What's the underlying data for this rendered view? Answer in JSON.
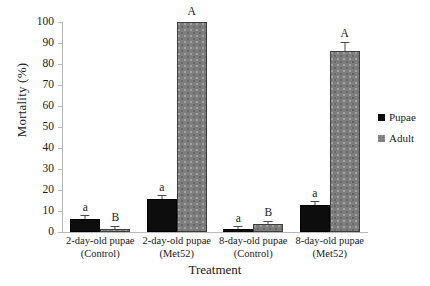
{
  "chart_data": {
    "type": "bar",
    "title": "",
    "xlabel": "Treatment",
    "ylabel": "Mortality (%)",
    "ylim": [
      0,
      100
    ],
    "ytick_step": 10,
    "yticks": [
      0,
      10,
      20,
      30,
      40,
      50,
      60,
      70,
      80,
      90,
      100
    ],
    "grid": false,
    "legend_position": "right",
    "categories": [
      "2-day-old pupae (Control)",
      "2-day-old pupae (Met52)",
      "8-day-old pupae (Control)",
      "8-day-old pupae (Met52)"
    ],
    "category_lines": [
      {
        "line1": "2-day-old pupae",
        "line2": "(Control)"
      },
      {
        "line1": "2-day-old pupae",
        "line2": "(Met52)"
      },
      {
        "line1": "8-day-old pupae",
        "line2": "(Control)"
      },
      {
        "line1": "8-day-old pupae",
        "line2": "(Met52)"
      }
    ],
    "series": [
      {
        "name": "Pupae",
        "color": "#0d0d0d",
        "values": [
          6.2,
          15.5,
          1.2,
          13.0
        ],
        "errors": [
          1.8,
          2.0,
          0.8,
          1.6
        ],
        "labels": [
          "a",
          "a",
          "a",
          "a"
        ]
      },
      {
        "name": "Adult",
        "color": "#7d7d7d",
        "values": [
          1.5,
          100.0,
          4.0,
          86.0
        ],
        "errors": [
          1.2,
          0.0,
          1.0,
          4.5
        ],
        "labels": [
          "B",
          "A",
          "B",
          "A"
        ]
      }
    ]
  },
  "legend": {
    "items": [
      {
        "label": "Pupae",
        "swatch": "pupae"
      },
      {
        "label": "Adult",
        "swatch": "adult"
      }
    ]
  }
}
